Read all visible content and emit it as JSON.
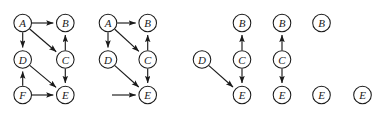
{
  "figure": {
    "node_radius": 8.8,
    "colors": {
      "node_fill": "#ffffff",
      "node_stroke": "#1a1a1a",
      "edge": "#1a1a1a",
      "label": "#1a1a1a",
      "background": "#ffffff"
    },
    "graphs": [
      {
        "id": "graph-1",
        "nodes": [
          {
            "label": "A",
            "x": 22.7,
            "y": 23.0
          },
          {
            "label": "B",
            "x": 65.3,
            "y": 23.0
          },
          {
            "label": "D",
            "x": 22.7,
            "y": 59.5
          },
          {
            "label": "C",
            "x": 65.3,
            "y": 59.5
          },
          {
            "label": "F",
            "x": 22.7,
            "y": 95.0
          },
          {
            "label": "E",
            "x": 65.3,
            "y": 95.0
          }
        ],
        "edges": [
          {
            "from": "A",
            "to": "B"
          },
          {
            "from": "A",
            "to": "D"
          },
          {
            "from": "A",
            "to": "C"
          },
          {
            "from": "C",
            "to": "B"
          },
          {
            "from": "C",
            "to": "E"
          },
          {
            "from": "D",
            "to": "E"
          },
          {
            "from": "F",
            "to": "D"
          },
          {
            "from": "F",
            "to": "E"
          }
        ],
        "dangling_edges": []
      },
      {
        "id": "graph-2",
        "nodes": [
          {
            "label": "A",
            "x": 108.0,
            "y": 23.0
          },
          {
            "label": "B",
            "x": 147.7,
            "y": 23.0
          },
          {
            "label": "D",
            "x": 108.0,
            "y": 59.5
          },
          {
            "label": "C",
            "x": 147.7,
            "y": 59.5
          },
          {
            "label": "E",
            "x": 147.7,
            "y": 95.0
          }
        ],
        "edges": [
          {
            "from": "A",
            "to": "B"
          },
          {
            "from": "A",
            "to": "D"
          },
          {
            "from": "A",
            "to": "C"
          },
          {
            "from": "C",
            "to": "B"
          },
          {
            "from": "C",
            "to": "E"
          },
          {
            "from": "D",
            "to": "E"
          }
        ],
        "dangling_edges": [
          {
            "to": "E",
            "from_x": 112.0,
            "from_y": 95.0
          }
        ]
      },
      {
        "id": "graph-3",
        "nodes": [
          {
            "label": "B",
            "x": 242.0,
            "y": 23.0
          },
          {
            "label": "D",
            "x": 202.0,
            "y": 59.5
          },
          {
            "label": "C",
            "x": 242.0,
            "y": 59.5
          },
          {
            "label": "E",
            "x": 242.0,
            "y": 95.0
          }
        ],
        "edges": [
          {
            "from": "C",
            "to": "B"
          },
          {
            "from": "C",
            "to": "E"
          },
          {
            "from": "D",
            "to": "E"
          }
        ],
        "dangling_edges": []
      },
      {
        "id": "graph-4",
        "nodes": [
          {
            "label": "B",
            "x": 282.0,
            "y": 23.0
          },
          {
            "label": "C",
            "x": 282.0,
            "y": 59.5
          },
          {
            "label": "E",
            "x": 282.0,
            "y": 95.0
          }
        ],
        "edges": [
          {
            "from": "C",
            "to": "B"
          },
          {
            "from": "C",
            "to": "E"
          }
        ],
        "dangling_edges": []
      },
      {
        "id": "graph-5",
        "nodes": [
          {
            "label": "B",
            "x": 321.5,
            "y": 23.0
          },
          {
            "label": "E",
            "x": 321.5,
            "y": 95.0
          }
        ],
        "edges": [],
        "dangling_edges": []
      },
      {
        "id": "graph-6",
        "nodes": [
          {
            "label": "E",
            "x": 362.5,
            "y": 95.0
          }
        ],
        "edges": [],
        "dangling_edges": []
      }
    ]
  }
}
